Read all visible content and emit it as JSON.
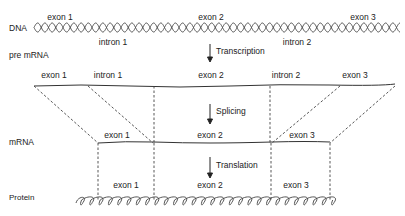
{
  "diagram": {
    "rows": {
      "dna": "DNA",
      "pre_mrna": "pre mRNA",
      "mrna": "mRNA",
      "protein": "Protein"
    },
    "dna_labels": {
      "exon1": "exon 1",
      "intron1": "intron 1",
      "exon2": "exon 2",
      "intron2": "intron 2",
      "exon3": "exon 3"
    },
    "pre_mrna_labels": {
      "exon1": "exon 1",
      "intron1": "intron 1",
      "exon2": "exon 2",
      "intron2": "intron 2",
      "exon3": "exon 3"
    },
    "mrna_labels": {
      "exon1": "exon 1",
      "exon2": "exon 2",
      "exon3": "exon 3"
    },
    "protein_labels": {
      "exon1": "exon 1",
      "exon2": "exon 2",
      "exon3": "exon 3"
    },
    "steps": {
      "transcription": "Transcription",
      "splicing": "Splicing",
      "translation": "Translation"
    },
    "colors": {
      "line": "#333333",
      "background": "#ffffff"
    }
  }
}
